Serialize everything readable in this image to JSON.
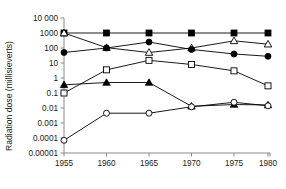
{
  "chart_data": {
    "type": "line",
    "title": "",
    "xlabel": "",
    "ylabel": "Radiation dose (millisieverts)",
    "x": [
      1955,
      1960,
      1965,
      1970,
      1975,
      1980
    ],
    "xtick_labels": [
      "1955",
      "1960",
      "1965",
      "1970",
      "1975",
      "1980"
    ],
    "xlim": [
      1955,
      1981
    ],
    "yscale": "log",
    "ylim": [
      1e-05,
      10000
    ],
    "ytick_values": [
      10000,
      1000,
      100,
      10,
      1,
      0.1,
      0.01,
      0.001,
      0.0001,
      1e-05
    ],
    "ytick_labels": [
      "10 000",
      "1000",
      "100",
      "10",
      "1",
      "0.1",
      "0.01",
      "0.001",
      "0.0001",
      "0.00001"
    ],
    "grid": false,
    "legend": "none",
    "series": [
      {
        "name": "series-filled-square",
        "marker": "filled-square",
        "color": "#000000",
        "values": [
          1000,
          1000,
          1000,
          1000,
          1000,
          1000
        ]
      },
      {
        "name": "series-open-triangle",
        "marker": "open-triangle",
        "color": "#000000",
        "values": [
          1000,
          105,
          50,
          100,
          300,
          180
        ]
      },
      {
        "name": "series-filled-circle",
        "marker": "filled-circle",
        "color": "#000000",
        "values": [
          50,
          100,
          250,
          80,
          40,
          28
        ]
      },
      {
        "name": "series-open-square",
        "marker": "open-square",
        "color": "#000000",
        "values": [
          0.1,
          3.5,
          15,
          8,
          3,
          0.3
        ]
      },
      {
        "name": "series-filled-triangle",
        "marker": "filled-triangle",
        "color": "#000000",
        "values": [
          0.35,
          0.5,
          0.5,
          0.013,
          0.017,
          0.016
        ]
      },
      {
        "name": "series-open-circle",
        "marker": "open-circle",
        "color": "#000000",
        "values": [
          7e-05,
          0.0045,
          0.0045,
          0.012,
          0.024,
          0.014
        ]
      }
    ]
  },
  "axes": {
    "y_title": "Radiation dose (millisieverts)"
  }
}
